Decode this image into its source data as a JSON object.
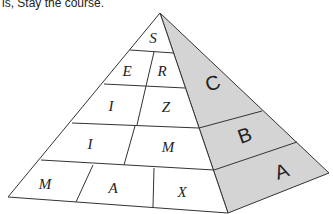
{
  "caption": "is, Stay the course.",
  "pyramid": {
    "front_rows": [
      [
        "S"
      ],
      [
        "E",
        "R"
      ],
      [
        "I",
        "Z"
      ],
      [
        "I",
        "M"
      ],
      [
        "M",
        "A",
        "X"
      ]
    ],
    "side_bands": [
      "C",
      "B",
      "A"
    ],
    "colors": {
      "front_face": "#ffffff",
      "side_face": "#d4d4d4",
      "edges": "#333333"
    }
  }
}
